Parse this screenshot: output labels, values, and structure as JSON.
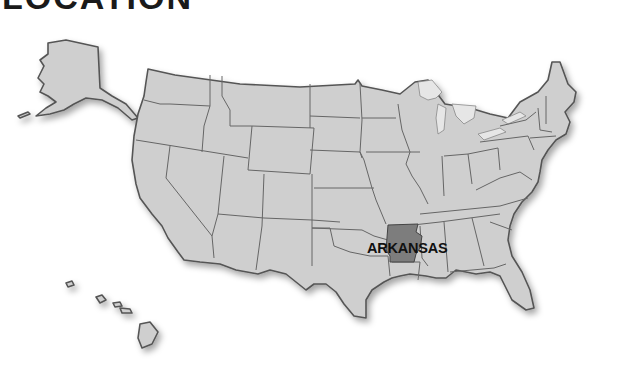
{
  "title": "LOCATION",
  "map": {
    "highlighted_state": "ARKANSAS",
    "highlight_label": "ARKANSAS",
    "colors": {
      "land": "#cfcfcf",
      "highlight": "#7d7d7d",
      "border": "#555555",
      "background": "#ffffff"
    },
    "insets": [
      "Alaska",
      "Hawaii"
    ]
  }
}
